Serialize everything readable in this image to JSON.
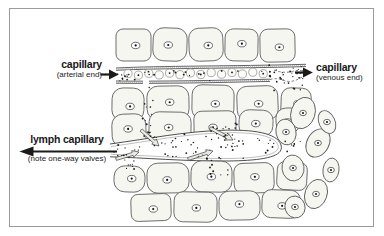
{
  "labels": {
    "arterial": {
      "title": "capillary",
      "subtitle": "(arterial end)"
    },
    "venous": {
      "title": "capillary",
      "subtitle": "(venous end)"
    },
    "lymph": {
      "title": "lymph capillary",
      "subtitle": "(note one-way valves)"
    }
  },
  "icons": {
    "arterial_arrow": "arrow-right-icon",
    "venous_arrow": "arrow-right-icon",
    "lymph_arrow": "arrow-left-icon",
    "valves": "one-way-valve-arrow-icon"
  },
  "colors": {
    "ink": "#1a1a1a",
    "frame": "#9b9b9b",
    "cell-fill": "#f6f6f1",
    "cell-stroke": "#5e5e5e",
    "wall": "#4f4f4f",
    "background": "#ffffff"
  }
}
